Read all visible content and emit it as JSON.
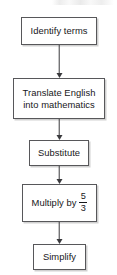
{
  "diagram": {
    "type": "flowchart",
    "orientation": "vertical",
    "title": "",
    "background_color": "#ffffff",
    "box_border_color": "#57575a",
    "text_color": "#17171a",
    "arrow_color": "#3a3a3d",
    "nodes": [
      {
        "id": "identify",
        "label": "Identify terms"
      },
      {
        "id": "translate",
        "label": "Translate English\ninto mathematics"
      },
      {
        "id": "substitute",
        "label": "Substitute"
      },
      {
        "id": "multiply",
        "label_prefix": "Multiply by",
        "fraction_numerator": "5",
        "fraction_denominator": "3"
      },
      {
        "id": "simplify",
        "label": "Simplify"
      }
    ],
    "connectors": [
      {
        "from": "identify",
        "to": "translate",
        "arrowhead": "down"
      },
      {
        "from": "translate",
        "to": "substitute",
        "arrowhead": "down"
      },
      {
        "from": "substitute",
        "to": "multiply",
        "arrowhead": "down"
      },
      {
        "from": "multiply",
        "to": "simplify",
        "arrowhead": "down"
      }
    ]
  }
}
